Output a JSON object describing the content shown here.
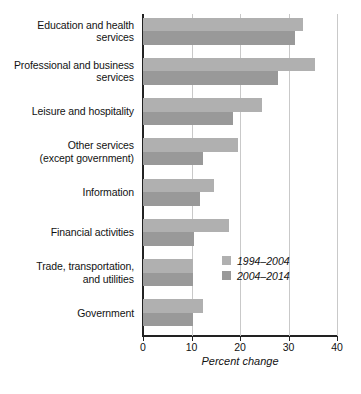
{
  "chart_data": {
    "type": "bar",
    "orientation": "horizontal",
    "title": "",
    "xlabel": "Percent change",
    "ylabel": "",
    "xlim": [
      0,
      40
    ],
    "xticks": [
      0,
      10,
      20,
      30,
      40
    ],
    "xtick_labels": [
      "0",
      "10",
      "20",
      "30",
      "40"
    ],
    "grid": "vertical",
    "legend_position": "inside-right-lower",
    "categories": [
      "Education and health\nservices",
      "Professional and business\nservices",
      "Leisure and hospitality",
      "Other services\n(except government)",
      "Information",
      "Financial activities",
      "Trade, transportation,\nand utilities",
      "Government"
    ],
    "series": [
      {
        "name": "1994–2004",
        "color": "#b0b0b0",
        "values": [
          33.0,
          35.5,
          24.5,
          19.5,
          14.6,
          17.8,
          10.4,
          12.3
        ]
      },
      {
        "name": "2004–2014",
        "color": "#999999",
        "values": [
          31.3,
          27.8,
          18.5,
          12.3,
          11.8,
          10.6,
          10.4,
          10.4
        ]
      }
    ]
  },
  "legend": {
    "items": [
      {
        "label": "1994–2004",
        "color": "#b0b0b0"
      },
      {
        "label": "2004–2014",
        "color": "#999999"
      }
    ]
  },
  "axis": {
    "x_title": "Percent change",
    "tick_labels": [
      "0",
      "10",
      "20",
      "30",
      "40"
    ]
  }
}
